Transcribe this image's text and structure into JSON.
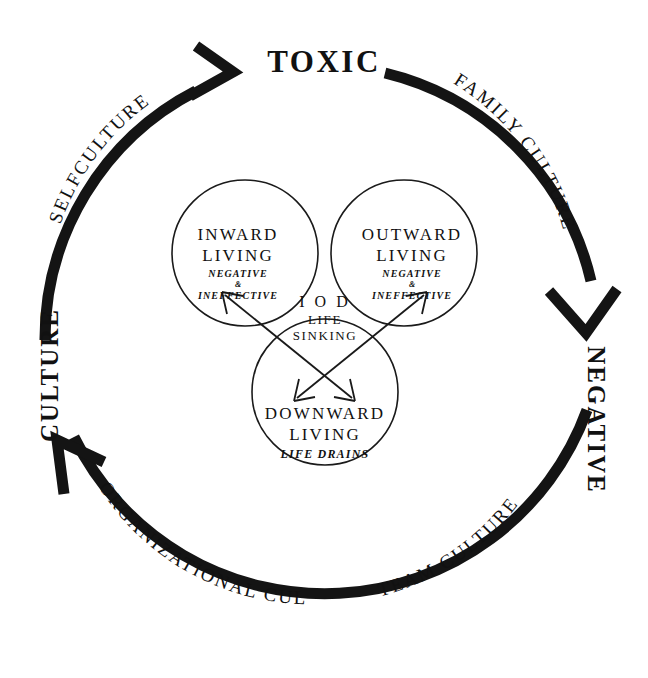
{
  "diagram": {
    "type": "cycle-venn",
    "title": "TOXIC",
    "background_color": "#ffffff",
    "ink_color": "#141414",
    "cycle": {
      "top_label": "TOXIC",
      "right_label": "NEGATIVE",
      "left_label": "CULTURE",
      "arc_labels": {
        "upper_left": "SELFCULTURE",
        "upper_right": "FAMILY CULTURE",
        "lower_left": "ORGANIZATIONAL CULTURE",
        "lower_right": "TEAM CULTURE"
      },
      "arrowheads": [
        "top-left-arrowhead-pointing-right",
        "right-arrowhead-pointing-down",
        "bottom-left-arrowhead-pointing-up"
      ]
    },
    "venn": {
      "circles": [
        {
          "id": "inward",
          "title_line1": "INWARD",
          "title_line2": "LIVING",
          "sub_line1": "NEGATIVE",
          "sub_amp": "&",
          "sub_line2": "INEFFECTIVE"
        },
        {
          "id": "outward",
          "title_line1": "OUTWARD",
          "title_line2": "LIVING",
          "sub_line1": "NEGATIVE",
          "sub_amp": "&",
          "sub_line2": "INEFFECTIVE"
        },
        {
          "id": "downward",
          "title_line1": "DOWNWARD",
          "title_line2": "LIVING",
          "sub_line1": "LIFE DRAINS"
        }
      ],
      "center": {
        "line1": "I O D",
        "line2": "LIFE",
        "line3": "SINKING"
      },
      "cross_arrows": {
        "count": 2,
        "style": "double-headed",
        "description": "two crossing double-headed arrows forming an X between the upper circles and the lower circle"
      }
    }
  }
}
